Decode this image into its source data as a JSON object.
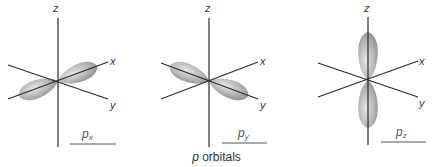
{
  "figure": {
    "caption_italic": "p",
    "caption_rest": " orbitals",
    "axis_labels": {
      "x": "x",
      "y": "y",
      "z": "z"
    },
    "orbitals": [
      {
        "name": "p",
        "subscript": "x",
        "orientation": "along x-axis"
      },
      {
        "name": "p",
        "subscript": "y",
        "orientation": "along y-axis"
      },
      {
        "name": "p",
        "subscript": "z",
        "orientation": "along z-axis"
      }
    ],
    "colors": {
      "lobe_light": "#e4e4e4",
      "lobe_dark": "#8e8e8e",
      "axis": "#2a2a2a"
    }
  }
}
